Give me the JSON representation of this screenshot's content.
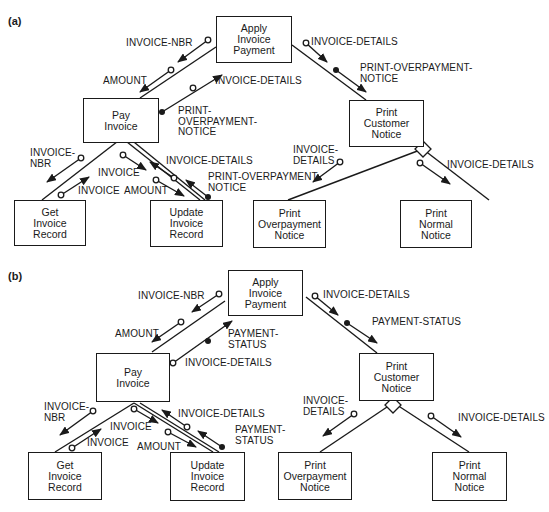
{
  "panels": [
    {
      "id": "a",
      "label": "(a)",
      "modules": {
        "apply": "Apply\nInvoice\nPayment",
        "pay": "Pay\nInvoice",
        "print_customer": "Print\nCustomer\nNotice",
        "get": "Get\nInvoice\nRecord",
        "update": "Update\nInvoice\nRecord",
        "print_overpayment": "Print\nOverpayment\nNotice",
        "print_normal": "Print\nNormal\nNotice"
      },
      "couples": {
        "apply_pay_invoice_nbr": "INVOICE-NBR",
        "apply_pay_amount": "AMOUNT",
        "pay_apply_invoice_details": "INVOICE-DETAILS",
        "pay_apply_flag": "PRINT-\nOVERPAYMENT-\nNOTICE",
        "apply_print_invoice_details": "INVOICE-DETAILS",
        "apply_print_flag": "PRINT-OVERPAYMENT-\nNOTICE",
        "pay_get_invoice_nbr": "INVOICE-\nNBR",
        "get_pay_invoice": "INVOICE",
        "pay_update_invoice": "INVOICE",
        "pay_update_amount": "AMOUNT",
        "update_pay_invoice_details": "INVOICE-DETAILS",
        "update_pay_flag": "PRINT-OVERPAYMENT-\nNOTICE",
        "print_over_invoice_details": "INVOICE-\nDETAILS",
        "print_normal_invoice_details": "INVOICE-DETAILS"
      }
    },
    {
      "id": "b",
      "label": "(b)",
      "modules": {
        "apply": "Apply\nInvoice\nPayment",
        "pay": "Pay\nInvoice",
        "print_customer": "Print\nCustomer\nNotice",
        "get": "Get\nInvoice\nRecord",
        "update": "Update\nInvoice\nRecord",
        "print_overpayment": "Print\nOverpayment\nNotice",
        "print_normal": "Print\nNormal\nNotice"
      },
      "couples": {
        "apply_pay_invoice_nbr": "INVOICE-NBR",
        "apply_pay_amount": "AMOUNT",
        "pay_apply_flag": "PAYMENT-\nSTATUS",
        "pay_apply_invoice_details": "INVOICE-DETAILS",
        "apply_print_invoice_details": "INVOICE-DETAILS",
        "apply_print_flag": "PAYMENT-STATUS",
        "pay_get_invoice_nbr": "INVOICE-\nNBR",
        "get_pay_invoice": "INVOICE",
        "pay_update_invoice": "INVOICE",
        "pay_update_amount": "AMOUNT",
        "update_pay_invoice_details": "INVOICE-DETAILS",
        "update_pay_flag": "PAYMENT-\nSTATUS",
        "print_over_invoice_details": "INVOICE-\nDETAILS",
        "print_normal_invoice_details": "INVOICE-DETAILS"
      }
    }
  ]
}
